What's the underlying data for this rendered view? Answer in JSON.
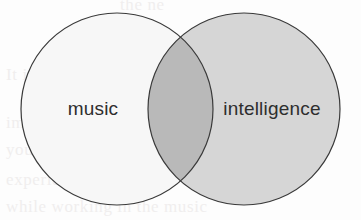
{
  "figure": {
    "type": "venn-diagram",
    "background_color": "#fdfdfd",
    "title": "",
    "sets": [
      {
        "id": "left",
        "label": "music",
        "fill_color": "#f7f7f7",
        "stroke_color": "#3a3a3a",
        "center_x": 117,
        "center_y": 109,
        "radius": 96,
        "label_x": 93,
        "label_y": 115
      },
      {
        "id": "right",
        "label": "intelligence",
        "fill_color": "#d6d6d6",
        "stroke_color": "#3a3a3a",
        "center_x": 244,
        "center_y": 109,
        "radius": 96,
        "label_x": 272,
        "label_y": 115
      }
    ],
    "intersection": {
      "label": "",
      "fill_color": "#b9b9b9"
    },
    "stroke_width": 1.2,
    "label_color": "#2e2e2e"
  },
  "chart_data": {
    "type": "venn",
    "title": "",
    "categories": [
      "music",
      "intelligence"
    ],
    "values": [
      1,
      1
    ],
    "intersection_label": "",
    "xlabel": "",
    "ylabel": "",
    "legend": []
  },
  "scan_bleed": {
    "lines": [
      "the ne",
      "It is no reason to exercise and a",
      "improve performance or search",
      "your way to connect to",
      "experience and that the",
      "while working in the music"
    ]
  }
}
